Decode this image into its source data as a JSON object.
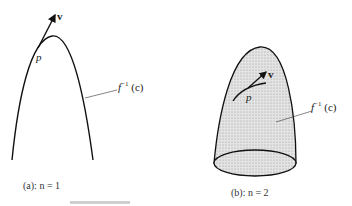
{
  "panels": [
    {
      "id": "a",
      "caption": "(a):  n = 1",
      "vector_label": "v",
      "point_label": "p",
      "set_label_base": "f",
      "set_label_exp": "−1",
      "set_label_arg": " (c)"
    },
    {
      "id": "b",
      "caption": "(b):  n = 2",
      "vector_label": "v",
      "point_label": "p",
      "set_label_base": "f",
      "set_label_exp": "−1",
      "set_label_arg": " (c)"
    }
  ],
  "colors": {
    "line": "#111111",
    "fill": "#d9d9d9"
  }
}
